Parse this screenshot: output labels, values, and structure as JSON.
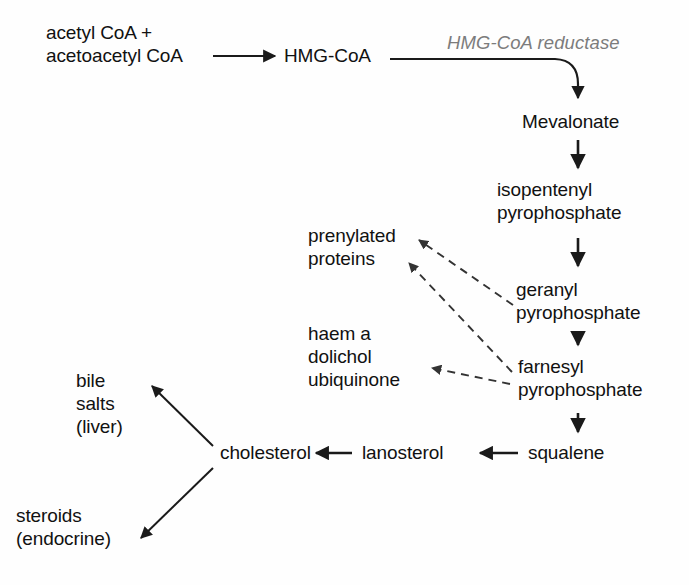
{
  "diagram": {
    "background_color": "#fefefe",
    "text_color": "#111111",
    "enzyme_color": "#7c7c7c",
    "arrow_color": "#1a1a1a",
    "dashed_arrow_color": "#555555"
  },
  "nodes": {
    "substrates": "acetyl CoA +\nacetoacetyl CoA",
    "hmg_coa": "HMG-CoA",
    "mevalonate": "Mevalonate",
    "isopentenyl_pp": "isopentenyl\npyrophosphate",
    "geranyl_pp": "geranyl\npyrophosphate",
    "farnesyl_pp": "farnesyl\npyrophosphate",
    "squalene": "squalene",
    "lanosterol": "lanosterol",
    "cholesterol": "cholesterol",
    "prenylated_proteins": "prenylated\nproteins",
    "haem_dolichol_ubiquinone": "haem a\ndolichol\nubiquinone",
    "bile_salts": "bile\nsalts\n(liver)",
    "steroids": "steroids\n(endocrine)"
  },
  "enzymes": {
    "hmg_coa_reductase": "HMG-CoA reductase"
  },
  "edges": [
    {
      "name": "substrates-to-hmgcoa",
      "from": "acetyl CoA + acetoacetyl CoA",
      "to": "HMG-CoA",
      "style": "solid",
      "direction": "right"
    },
    {
      "name": "hmgcoa-to-mevalonate",
      "from": "HMG-CoA",
      "to": "Mevalonate",
      "style": "solid",
      "direction": "curve-down",
      "enzyme": "HMG-CoA reductase"
    },
    {
      "name": "mevalonate-to-ipp",
      "from": "Mevalonate",
      "to": "isopentenyl pyrophosphate",
      "style": "solid",
      "direction": "down"
    },
    {
      "name": "ipp-to-gpp",
      "from": "isopentenyl pyrophosphate",
      "to": "geranyl pyrophosphate",
      "style": "solid",
      "direction": "down"
    },
    {
      "name": "gpp-to-fpp",
      "from": "geranyl pyrophosphate",
      "to": "farnesyl pyrophosphate",
      "style": "solid",
      "direction": "down"
    },
    {
      "name": "fpp-to-squalene",
      "from": "farnesyl pyrophosphate",
      "to": "squalene",
      "style": "solid",
      "direction": "down"
    },
    {
      "name": "squalene-to-lanosterol",
      "from": "squalene",
      "to": "lanosterol",
      "style": "solid",
      "direction": "left"
    },
    {
      "name": "lanosterol-to-cholesterol",
      "from": "lanosterol",
      "to": "cholesterol",
      "style": "solid",
      "direction": "left"
    },
    {
      "name": "cholesterol-to-bile-salts",
      "from": "cholesterol",
      "to": "bile salts (liver)",
      "style": "solid",
      "direction": "upper-left"
    },
    {
      "name": "cholesterol-to-steroids",
      "from": "cholesterol",
      "to": "steroids (endocrine)",
      "style": "solid",
      "direction": "lower-left"
    },
    {
      "name": "gpp-to-prenylated",
      "from": "geranyl pyrophosphate",
      "to": "prenylated proteins",
      "style": "dashed",
      "direction": "upper-left"
    },
    {
      "name": "fpp-to-prenylated",
      "from": "farnesyl pyrophosphate",
      "to": "prenylated proteins",
      "style": "dashed",
      "direction": "upper-left"
    },
    {
      "name": "fpp-to-haem",
      "from": "farnesyl pyrophosphate",
      "to": "haem a dolichol ubiquinone",
      "style": "dashed",
      "direction": "left"
    }
  ]
}
